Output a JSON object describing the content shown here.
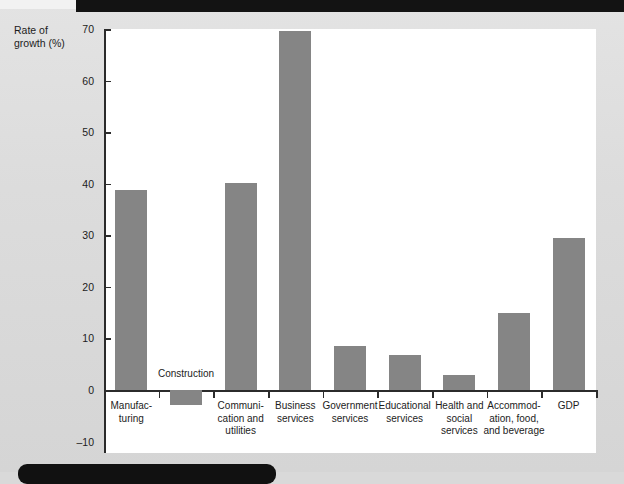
{
  "chart_data": {
    "type": "bar",
    "title": "",
    "xlabel": "",
    "ylabel": "Rate of growth (%)",
    "ylim": [
      -10,
      70
    ],
    "yticks": [
      70,
      60,
      50,
      40,
      30,
      20,
      10,
      0,
      -10
    ],
    "ytick_labels": [
      "70",
      "60",
      "50",
      "40",
      "30",
      "20",
      "10",
      "0",
      "–10"
    ],
    "grid": false,
    "legend": "none",
    "bar_color": "#858585",
    "categories": [
      "Manufac-\nturing",
      "Construction",
      "Communi-\ncation and\nutilities",
      "Business\nservices",
      "Government\nservices",
      "Educational\nservices",
      "Health and\nsocial\nservices",
      "Accommod-\nation, food,\nand beverage",
      "GDP"
    ],
    "values": [
      38.8,
      -3.0,
      40.2,
      69.6,
      8.5,
      6.8,
      3.0,
      15.0,
      29.4
    ],
    "label_placement": [
      "below",
      "above",
      "below",
      "below",
      "below",
      "below",
      "below",
      "below",
      "below"
    ]
  },
  "axis": {
    "y_title_line1": "Rate of",
    "y_title_line2": "growth (%)"
  },
  "categories_display": [
    {
      "lines": [
        "Manufac-",
        "turing"
      ]
    },
    {
      "lines": [
        "Construction"
      ]
    },
    {
      "lines": [
        "Communi-",
        "cation and",
        "utilities"
      ]
    },
    {
      "lines": [
        "Business",
        "services"
      ]
    },
    {
      "lines": [
        "Government",
        "services"
      ]
    },
    {
      "lines": [
        "Educational",
        "services"
      ]
    },
    {
      "lines": [
        "Health and",
        "social",
        "services"
      ]
    },
    {
      "lines": [
        "Accommod-",
        "ation, food,",
        "and beverage"
      ]
    },
    {
      "lines": [
        "GDP"
      ]
    }
  ]
}
